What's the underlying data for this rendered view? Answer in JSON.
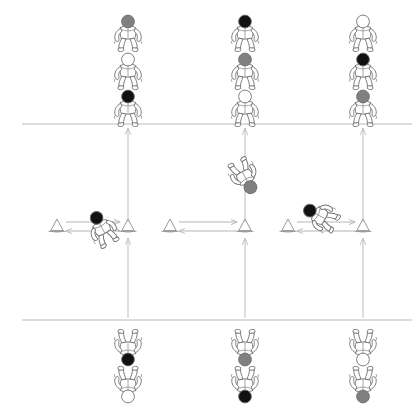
{
  "diagram": {
    "canvas": {
      "width": 417,
      "height": 417,
      "background": "#ffffff"
    },
    "colors": {
      "head_dark": "#111111",
      "head_gray": "#808080",
      "head_light": "#ffffff",
      "court_line": "#b9b9b9",
      "path_line": "#bdbdbd",
      "cone": "#9a9a9a",
      "figure_stroke": "#6f6f6f"
    },
    "court_lines": [
      {
        "name": "top-service-line",
        "y": 124
      },
      {
        "name": "bottom-service-line",
        "y": 320
      }
    ],
    "lanes": [
      {
        "name": "left-lane",
        "x": 128
      },
      {
        "name": "center-lane",
        "x": 245
      },
      {
        "name": "right-lane",
        "x": 363
      }
    ],
    "cone_pairs": [
      {
        "name": "left-shuttle",
        "left_cone_x": 57,
        "right_cone_x": 128,
        "y": 228
      },
      {
        "name": "center-shuttle",
        "left_cone_x": 170,
        "right_cone_x": 245,
        "y": 228
      },
      {
        "name": "right-shuttle",
        "left_cone_x": 288,
        "right_cone_x": 363,
        "y": 228
      }
    ],
    "queues": {
      "top": [
        {
          "lane": "left-lane",
          "x": 128,
          "players": [
            {
              "label": "player-top-left-1",
              "head": "gray",
              "y": 33
            },
            {
              "label": "player-top-left-2",
              "head": "light",
              "y": 71
            },
            {
              "label": "player-top-left-3",
              "head": "dark",
              "y": 108
            }
          ]
        },
        {
          "lane": "center-lane",
          "x": 245,
          "players": [
            {
              "label": "player-top-center-1",
              "head": "dark",
              "y": 33
            },
            {
              "label": "player-top-center-2",
              "head": "gray",
              "y": 71
            },
            {
              "label": "player-top-center-3",
              "head": "light",
              "y": 108
            }
          ]
        },
        {
          "lane": "right-lane",
          "x": 363,
          "players": [
            {
              "label": "player-top-right-1",
              "head": "light",
              "y": 33
            },
            {
              "label": "player-top-right-2",
              "head": "dark",
              "y": 71
            },
            {
              "label": "player-top-right-3",
              "head": "gray",
              "y": 108
            }
          ]
        }
      ],
      "bottom": [
        {
          "lane": "left-lane",
          "x": 128,
          "players": [
            {
              "label": "player-bottom-left-1",
              "head": "dark",
              "y": 348
            },
            {
              "label": "player-bottom-left-2",
              "head": "light",
              "y": 385
            }
          ]
        },
        {
          "lane": "center-lane",
          "x": 245,
          "players": [
            {
              "label": "player-bottom-center-1",
              "head": "gray",
              "y": 348
            },
            {
              "label": "player-bottom-center-2",
              "head": "dark",
              "y": 385
            }
          ]
        },
        {
          "lane": "right-lane",
          "x": 363,
          "players": [
            {
              "label": "player-bottom-right-1",
              "head": "light",
              "y": 348
            },
            {
              "label": "player-bottom-right-2",
              "head": "gray",
              "y": 385
            }
          ]
        }
      ]
    },
    "active_players": [
      {
        "label": "active-left",
        "head": "dark",
        "x": 102,
        "y": 228,
        "rotation": -28
      },
      {
        "label": "active-center",
        "head": "gray",
        "x": 245,
        "y": 177,
        "rotation": 152
      },
      {
        "label": "active-right",
        "head": "dark",
        "x": 320,
        "y": 216,
        "rotation": -62
      }
    ]
  }
}
